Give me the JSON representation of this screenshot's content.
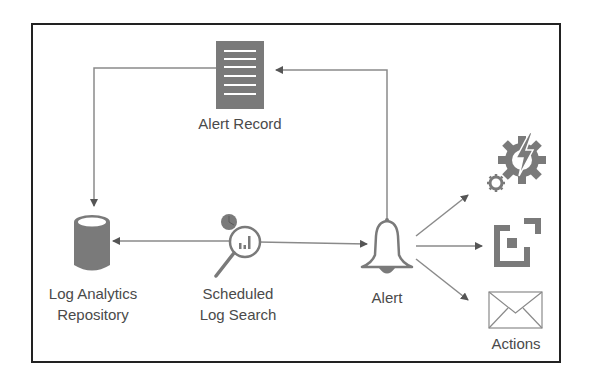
{
  "diagram": {
    "nodes": {
      "alert_record": {
        "label": "Alert Record",
        "icon": "document-lines-icon"
      },
      "repository": {
        "label_line1": "Log Analytics",
        "label_line2": "Repository",
        "icon": "database-cylinder-icon"
      },
      "log_search": {
        "label_line1": "Scheduled",
        "label_line2": "Log Search",
        "icon": "magnifier-chart-clock-icon"
      },
      "alert": {
        "label": "Alert",
        "icon": "bell-icon"
      },
      "actions": {
        "label": "Actions",
        "icons": [
          "automation-gear-lightning-icon",
          "webhook-frame-icon",
          "email-envelope-icon"
        ]
      }
    },
    "edges": [
      {
        "from": "log_search",
        "to": "repository",
        "style": "arrow"
      },
      {
        "from": "log_search",
        "to": "alert",
        "style": "arrow"
      },
      {
        "from": "alert",
        "to": "alert_record",
        "style": "arrow"
      },
      {
        "from": "alert_record",
        "to": "repository",
        "style": "arrow"
      },
      {
        "from": "alert",
        "to": "automation-action",
        "style": "arrow"
      },
      {
        "from": "alert",
        "to": "webhook-action",
        "style": "arrow"
      },
      {
        "from": "alert",
        "to": "email-action",
        "style": "arrow"
      }
    ],
    "colors": {
      "icon_fill": "#7a7a7a",
      "line": "#8a8a8a",
      "text": "#4a4a4a",
      "frame": "#222222"
    }
  }
}
